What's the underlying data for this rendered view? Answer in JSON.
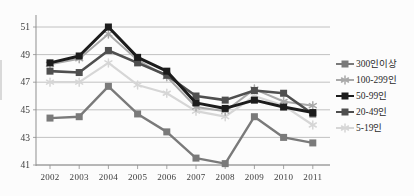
{
  "chart_data": {
    "type": "line",
    "title": "",
    "xlabel": "",
    "ylabel": "",
    "categories": [
      "2002",
      "2003",
      "2004",
      "2005",
      "2006",
      "2007",
      "2008",
      "2009",
      "2010",
      "2011"
    ],
    "y_axis": {
      "ticks": [
        41,
        43,
        45,
        47,
        49,
        51
      ],
      "range": [
        41,
        51
      ]
    },
    "grid": true,
    "legend_position": "right",
    "series": [
      {
        "name": "300인이상",
        "marker": "square",
        "color": "#7a7a7a",
        "values": [
          44.4,
          44.5,
          46.7,
          44.7,
          43.4,
          41.5,
          41.1,
          44.5,
          43.0,
          42.6
        ]
      },
      {
        "name": "100-299인",
        "marker": "star",
        "color": "#a9a9a9",
        "values": [
          48.3,
          48.7,
          50.5,
          48.6,
          47.4,
          45.2,
          44.9,
          46.5,
          45.6,
          45.3
        ]
      },
      {
        "name": "50-99인",
        "marker": "square",
        "color": "#1c1c1c",
        "values": [
          48.4,
          48.9,
          51.0,
          48.8,
          47.8,
          45.5,
          45.1,
          45.7,
          45.2,
          44.8
        ]
      },
      {
        "name": "20-49인",
        "marker": "square",
        "color": "#4f4f4f",
        "values": [
          47.8,
          47.7,
          49.3,
          48.4,
          47.5,
          46.0,
          45.7,
          46.4,
          46.2,
          44.7
        ]
      },
      {
        "name": "5-19인",
        "marker": "star",
        "color": "#d6d6d6",
        "values": [
          47.0,
          47.0,
          48.4,
          46.8,
          46.2,
          44.9,
          44.5,
          46.0,
          45.3,
          43.9
        ]
      }
    ]
  },
  "colors": {
    "background": "#fcfcfc",
    "gridline": "#b2b2b2",
    "axis": "#8f8f8f",
    "tick_text": "#3c3c3c"
  }
}
